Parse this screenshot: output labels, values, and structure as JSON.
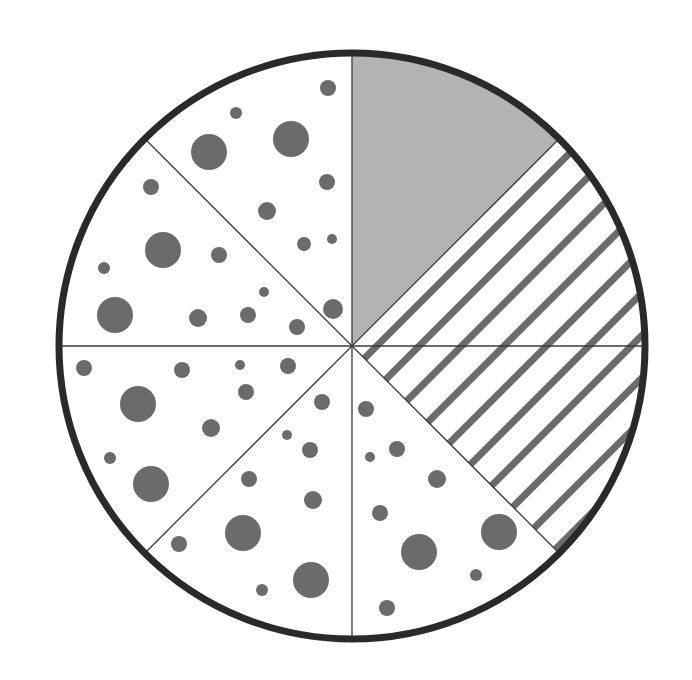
{
  "diagram": {
    "title": "Fraction circle divided into 8 equal parts",
    "description": "Circle divided into eighths: 1 eighth solid gray, 2 eighths striped, 5 eighths dotted",
    "colors": {
      "background": "#ffffff",
      "outline": "#2a2a2a",
      "divider": "#3a3a3a",
      "solid_fill": "#b3b3b3",
      "pattern": "#6b6b6b"
    },
    "circle": {
      "cx": 352,
      "cy": 346,
      "r": 293,
      "stroke_width": 7
    },
    "total_parts": 8,
    "sectors": [
      {
        "index": 0,
        "start_deg": 0,
        "end_deg": 45,
        "fill": "solid-gray"
      },
      {
        "index": 1,
        "start_deg": 45,
        "end_deg": 90,
        "fill": "stripes"
      },
      {
        "index": 2,
        "start_deg": 90,
        "end_deg": 135,
        "fill": "stripes"
      },
      {
        "index": 3,
        "start_deg": 135,
        "end_deg": 180,
        "fill": "dots"
      },
      {
        "index": 4,
        "start_deg": 180,
        "end_deg": 225,
        "fill": "dots"
      },
      {
        "index": 5,
        "start_deg": 225,
        "end_deg": 270,
        "fill": "dots"
      },
      {
        "index": 6,
        "start_deg": 270,
        "end_deg": 315,
        "fill": "dots"
      },
      {
        "index": 7,
        "start_deg": 315,
        "end_deg": 360,
        "fill": "dots"
      }
    ],
    "summary": {
      "solid_gray_parts": 1,
      "striped_parts": 2,
      "dotted_parts": 5
    },
    "stripes": {
      "period": 30,
      "width": 7,
      "angle_deg": -45
    },
    "dots": [
      [
        328,
        88,
        8
      ],
      [
        236,
        113,
        6
      ],
      [
        291,
        139,
        18
      ],
      [
        209,
        152,
        18
      ],
      [
        327,
        182,
        8
      ],
      [
        267,
        211,
        9
      ],
      [
        304,
        244,
        7
      ],
      [
        332,
        239,
        5
      ],
      [
        333,
        309,
        10
      ],
      [
        151,
        187,
        8
      ],
      [
        163,
        250,
        18
      ],
      [
        219,
        255,
        8
      ],
      [
        104,
        268,
        6
      ],
      [
        115,
        315,
        18
      ],
      [
        198,
        318,
        9
      ],
      [
        248,
        315,
        8
      ],
      [
        264,
        292,
        5
      ],
      [
        297,
        327,
        8
      ],
      [
        84,
        368,
        8
      ],
      [
        182,
        370,
        8
      ],
      [
        240,
        365,
        5
      ],
      [
        288,
        366,
        8
      ],
      [
        246,
        392,
        8
      ],
      [
        138,
        404,
        18
      ],
      [
        211,
        428,
        9
      ],
      [
        110,
        458,
        6
      ],
      [
        151,
        484,
        18
      ],
      [
        322,
        402,
        8
      ],
      [
        287,
        435,
        5
      ],
      [
        310,
        450,
        8
      ],
      [
        249,
        479,
        8
      ],
      [
        313,
        500,
        9
      ],
      [
        243,
        533,
        18
      ],
      [
        179,
        544,
        8
      ],
      [
        311,
        580,
        18
      ],
      [
        262,
        590,
        6
      ],
      [
        366,
        409,
        8
      ],
      [
        397,
        449,
        8
      ],
      [
        370,
        457,
        5
      ],
      [
        437,
        479,
        9
      ],
      [
        380,
        513,
        8
      ],
      [
        499,
        532,
        18
      ],
      [
        419,
        552,
        18
      ],
      [
        476,
        575,
        6
      ],
      [
        387,
        608,
        8
      ]
    ]
  }
}
